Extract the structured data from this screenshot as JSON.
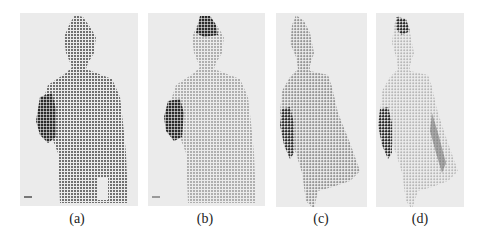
{
  "figure": {
    "panels": [
      {
        "id": "a",
        "label": "(a)",
        "description": "front view depth points, dark dotted grid",
        "dot_color": "#555555"
      },
      {
        "id": "b",
        "label": "(b)",
        "description": "front view, lighter dotted grid with dark head and arm",
        "dot_color": "#9a9a9a"
      },
      {
        "id": "c",
        "label": "(c)",
        "description": "rotated 3D view of point cloud",
        "dot_color": "#8a8a8a"
      },
      {
        "id": "d",
        "label": "(d)",
        "description": "rotated 3D view, lighter rendering",
        "dot_color": "#aaaaaa"
      }
    ],
    "background_color": "#ebebeb",
    "accent_dark": "#333333"
  }
}
